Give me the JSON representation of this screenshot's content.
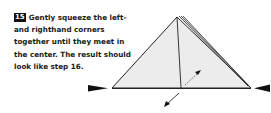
{
  "step": {
    "number": "15",
    "text": "Gently squeeze the left- and righthand corners together until they meet in the center. The result should look like step 16."
  },
  "diagram": {
    "paper_fill": "#ececec",
    "stroke": "#222222",
    "icons": [
      "push-left-arrow-icon",
      "push-right-arrow-icon",
      "fold-dashed-arrow-icon",
      "fold-solid-arrow-icon"
    ]
  }
}
